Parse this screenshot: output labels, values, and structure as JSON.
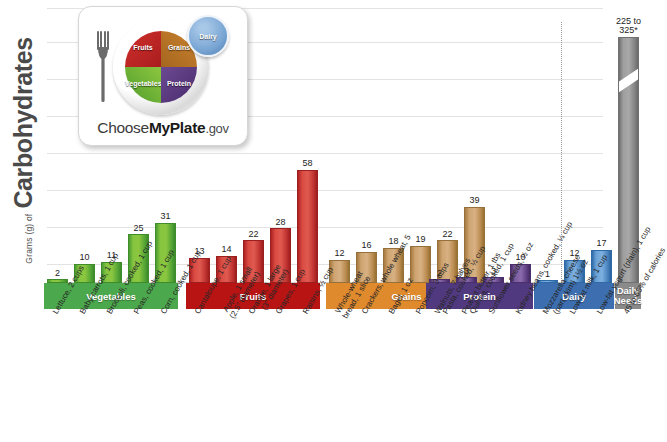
{
  "axis": {
    "y_prefix": "Grams (g) of",
    "y_title": "Carbohydrates"
  },
  "logo": {
    "fork_icon": "fork-icon",
    "quadrants": {
      "fruits": "Fruits",
      "grains": "Grains",
      "vegetables": "Vegetables",
      "protein": "Protein"
    },
    "dairy": "Dairy",
    "wordmark_pre": "Choose",
    "wordmark_bold": "MyPlate",
    "wordmark_post": ".gov"
  },
  "bands": [
    {
      "label": "Vegetables",
      "color": "#4CA84C"
    },
    {
      "label": "Fruits",
      "color": "#B81414"
    },
    {
      "label": "Grains",
      "color": "#E08A2E"
    },
    {
      "label": "Protein",
      "color": "#51397F"
    },
    {
      "label": "Dairy",
      "color": "#3D6FB0"
    },
    {
      "label": "Daily Needs",
      "label2": "Needs",
      "label1": "Daily",
      "color": "#8A8A8A"
    }
  ],
  "chart_data": {
    "type": "bar",
    "title": "Grams (g) of Carbohydrates",
    "xlabel": "",
    "ylabel": "Grams (g) of Carbohydrates",
    "ylim": [
      0,
      140
    ],
    "grid": true,
    "legend": false,
    "categories": [
      "Lettuce, 2 cups",
      "Baby carrots, 1 cup",
      "Broccoli, cooked, 1 cup",
      "Peas, cooked, 1 cup",
      "Corn, cooked, 1 cup",
      "Cantaloupe, 1 cup",
      "Apple, 1 small (2.5\" diameter)",
      "Orange, 1 large (3\" diameter)",
      "Grapes, 1 cup",
      "Raisins, 1/2 cup",
      "Whole-wheat bread, 1 slice",
      "Crackers, whole wheat, 5",
      "Bagel, 1 oz",
      "Popcorn, 3 cups",
      "Pasta, cooked, 1/2 cup",
      "Quinoa, cooked, 1 cup",
      "Walnuts, 7 halves",
      "Peanut butter, 1 tbs",
      "Sunflower seeds, 1/2 oz",
      "Kidney beans, cooked, 1/4 cup",
      "Mozzarella cheese (part skim) 1 1/2 oz",
      "Low-fat milk, 1 cup",
      "Low-fat yogurt (plain), 1 cup",
      "45 to 65% of calories"
    ],
    "values": [
      2,
      10,
      11,
      25,
      31,
      13,
      14,
      22,
      28,
      58,
      12,
      16,
      18,
      19,
      22,
      39,
      2,
      3,
      3,
      10,
      1,
      12,
      17,
      275
    ],
    "value_labels": [
      "2",
      "10",
      "11",
      "25",
      "31",
      "13",
      "14",
      "22",
      "28",
      "58",
      "12",
      "16",
      "18",
      "19",
      "22",
      "39",
      "2",
      "3",
      "3",
      "10",
      "1",
      "12",
      "17",
      "225 to 325*"
    ],
    "groups": [
      "Vegetables",
      "Fruits",
      "Grains",
      "Protein",
      "Dairy",
      "Daily Needs"
    ],
    "group_sizes": [
      5,
      5,
      6,
      4,
      3,
      1
    ]
  },
  "bars": [
    {
      "value": 2,
      "label": "2",
      "group": "veg",
      "x": 10
    },
    {
      "value": 10,
      "label": "10",
      "group": "veg",
      "x": 37
    },
    {
      "value": 11,
      "label": "11",
      "group": "veg",
      "x": 64
    },
    {
      "value": 25,
      "label": "25",
      "group": "veg",
      "x": 91
    },
    {
      "value": 31,
      "label": "31",
      "group": "veg",
      "x": 118
    },
    {
      "value": 13,
      "label": "13",
      "group": "fruit",
      "x": 152
    },
    {
      "value": 14,
      "label": "14",
      "group": "fruit",
      "x": 179
    },
    {
      "value": 22,
      "label": "22",
      "group": "fruit",
      "x": 206
    },
    {
      "value": 28,
      "label": "28",
      "group": "fruit",
      "x": 233
    },
    {
      "value": 58,
      "label": "58",
      "group": "fruit",
      "x": 260
    },
    {
      "value": 12,
      "label": "12",
      "group": "grain",
      "x": 292
    },
    {
      "value": 16,
      "label": "16",
      "group": "grain",
      "x": 319
    },
    {
      "value": 18,
      "label": "18",
      "group": "grain",
      "x": 346
    },
    {
      "value": 19,
      "label": "19",
      "group": "grain",
      "x": 373
    },
    {
      "value": 22,
      "label": "22",
      "group": "grain",
      "x": 400
    },
    {
      "value": 39,
      "label": "39",
      "group": "grain",
      "x": 427
    },
    {
      "value": 2,
      "label": "2",
      "group": "protein",
      "x": 392
    },
    {
      "value": 3,
      "label": "3",
      "group": "protein",
      "x": 419
    },
    {
      "value": 3,
      "label": "3",
      "group": "protein",
      "x": 446
    },
    {
      "value": 10,
      "label": "10",
      "group": "protein",
      "x": 473
    },
    {
      "value": 1,
      "label": "1",
      "group": "dairy",
      "x": 500
    },
    {
      "value": 12,
      "label": "12",
      "group": "dairy",
      "x": 527
    },
    {
      "value": 17,
      "label": "17",
      "group": "dairy",
      "x": 554
    },
    {
      "value": 275,
      "label": "225 to 325*",
      "group": "daily",
      "x": 581
    }
  ]
}
